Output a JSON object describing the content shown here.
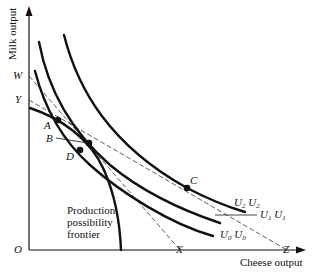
{
  "figure": {
    "y_axis_label": "Milk output",
    "x_axis_label": "Cheese output",
    "origin_label": "O",
    "intercepts": {
      "W": "W",
      "Y": "Y",
      "X": "X",
      "Z": "Z"
    },
    "points": {
      "A": "A",
      "B": "B",
      "C": "C",
      "D": "D"
    },
    "curves": {
      "ppf_label_line1": "Production",
      "ppf_label_line2": "possibility",
      "ppf_label_line3": "frontier",
      "u2_label": "U",
      "u2_sub": "2",
      "u2_label_b": "U",
      "u2_sub_b": "2",
      "u1_label": "U",
      "u1_sub": "1",
      "u1_label_b": "U",
      "u1_sub_b": "1",
      "u0_label": "U",
      "u0_sub": "0",
      "u0_label_b": "U",
      "u0_sub_b": "0"
    },
    "colors": {
      "ink": "#111111",
      "background": "#ffffff"
    }
  }
}
